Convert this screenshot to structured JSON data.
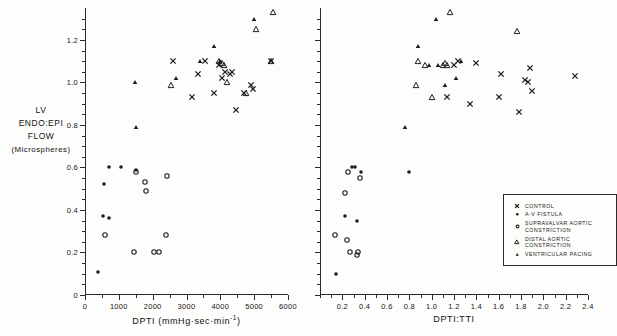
{
  "chart_data": {
    "type": "scatter",
    "title": "",
    "ylabel_lines": [
      "LV",
      "ENDO:EPI",
      "FLOW",
      "(Microspheres)"
    ],
    "ylim": [
      0,
      1.35
    ],
    "yticks": [
      0,
      0.2,
      0.4,
      0.6,
      0.8,
      1.0,
      1.2
    ],
    "ytick_labels": [
      "0",
      "0.2",
      "0.4",
      "0.6",
      "0.8",
      "1.0",
      "1.2"
    ],
    "grid": false,
    "legend_position": "right-panel-lower-right",
    "legend": [
      {
        "label": "CONTROL",
        "marker": "cross-x",
        "key": "control"
      },
      {
        "label": "A-V FISTULA",
        "marker": "filled-circle",
        "key": "av_fistula"
      },
      {
        "label": "SUPRAVALVAR AORTIC CONSTRICTION",
        "marker": "open-circle",
        "key": "supravalvar"
      },
      {
        "label": "DISTAL AORTIC CONSTRICTION",
        "marker": "open-triangle",
        "key": "distal_aortic"
      },
      {
        "label": "VENTRICULAR PACING",
        "marker": "filled-triangle",
        "key": "ventricular_pacing"
      }
    ],
    "panels": [
      {
        "id": "left",
        "xlabel": "DPTI  (mmHg·sec·min",
        "xlabel_sup": "-1",
        "xlabel_tail": ")",
        "xlim": [
          0,
          6000
        ],
        "xticks": [
          0,
          1000,
          2000,
          3000,
          4000,
          5000,
          6000
        ],
        "xtick_labels": [
          "0",
          "1000",
          "2000",
          "3000",
          "4000",
          "5000",
          "6000"
        ],
        "xminor_step": 500,
        "series": [
          {
            "key": "control",
            "marker": "cross-x",
            "points": [
              [
                2600,
                1.1
              ],
              [
                3150,
                0.93
              ],
              [
                3350,
                1.04
              ],
              [
                3550,
                1.1
              ],
              [
                3800,
                0.95
              ],
              [
                3950,
                1.08
              ],
              [
                4050,
                1.02
              ],
              [
                4150,
                1.05
              ],
              [
                4300,
                1.04
              ],
              [
                4350,
                1.05
              ],
              [
                4450,
                0.87
              ],
              [
                4700,
                0.95
              ],
              [
                4900,
                0.99
              ],
              [
                4980,
                0.97
              ],
              [
                5500,
                1.1
              ]
            ]
          },
          {
            "key": "av_fistula",
            "marker": "filled-circle",
            "points": [
              [
                380,
                0.11
              ],
              [
                520,
                0.37
              ],
              [
                560,
                0.52
              ],
              [
                700,
                0.36
              ],
              [
                720,
                0.6
              ],
              [
                1050,
                0.6
              ],
              [
                1520,
                0.59
              ]
            ]
          },
          {
            "key": "supravalvar",
            "marker": "open-circle",
            "points": [
              [
                600,
                0.28
              ],
              [
                1450,
                0.2
              ],
              [
                1500,
                0.58
              ],
              [
                1780,
                0.53
              ],
              [
                1800,
                0.49
              ],
              [
                2050,
                0.2
              ],
              [
                2200,
                0.2
              ],
              [
                2400,
                0.28
              ],
              [
                2420,
                0.56
              ]
            ]
          },
          {
            "key": "distal_aortic",
            "marker": "open-triangle",
            "points": [
              [
                2550,
                0.99
              ],
              [
                3950,
                1.1
              ],
              [
                4050,
                1.09
              ],
              [
                4100,
                1.08
              ],
              [
                4200,
                1.0
              ],
              [
                4750,
                0.95
              ],
              [
                5050,
                1.25
              ],
              [
                5500,
                1.1
              ],
              [
                5560,
                1.33
              ]
            ]
          },
          {
            "key": "ventricular_pacing",
            "marker": "filled-triangle",
            "points": [
              [
                1480,
                1.0
              ],
              [
                1500,
                0.79
              ],
              [
                2700,
                1.02
              ],
              [
                3400,
                1.1
              ],
              [
                3800,
                1.17
              ],
              [
                3980,
                1.1
              ],
              [
                5000,
                1.3
              ]
            ]
          }
        ]
      },
      {
        "id": "right",
        "xlabel": "DPTI:TTI",
        "xlim": [
          0,
          2.4
        ],
        "xticks": [
          0.2,
          0.4,
          0.6,
          0.8,
          1.0,
          1.2,
          1.4,
          1.6,
          1.8,
          2.0,
          2.2,
          2.4
        ],
        "xtick_labels": [
          "0.2",
          "0.4",
          "0.6",
          "0.8",
          "1.0",
          "1.2",
          "1.4",
          "1.6",
          "1.8",
          "2.0",
          "2.2",
          "2.4"
        ],
        "xminor_step": 0.1,
        "series": [
          {
            "key": "control",
            "marker": "cross-x",
            "points": [
              [
                1.14,
                0.93
              ],
              [
                1.2,
                1.08
              ],
              [
                1.24,
                1.1
              ],
              [
                1.34,
                0.9
              ],
              [
                1.4,
                1.09
              ],
              [
                1.6,
                0.93
              ],
              [
                1.62,
                1.04
              ],
              [
                1.78,
                0.86
              ],
              [
                1.84,
                1.01
              ],
              [
                1.86,
                1.0
              ],
              [
                1.88,
                1.07
              ],
              [
                1.9,
                0.96
              ],
              [
                2.28,
                1.03
              ]
            ]
          },
          {
            "key": "av_fistula",
            "marker": "filled-circle",
            "points": [
              [
                0.14,
                0.1
              ],
              [
                0.22,
                0.37
              ],
              [
                0.29,
                0.6
              ],
              [
                0.31,
                0.6
              ],
              [
                0.33,
                0.35
              ],
              [
                0.37,
                0.58
              ],
              [
                0.8,
                0.58
              ]
            ]
          },
          {
            "key": "supravalvar",
            "marker": "open-circle",
            "points": [
              [
                0.13,
                0.28
              ],
              [
                0.22,
                0.48
              ],
              [
                0.24,
                0.26
              ],
              [
                0.25,
                0.58
              ],
              [
                0.27,
                0.2
              ],
              [
                0.33,
                0.19
              ],
              [
                0.34,
                0.2
              ],
              [
                0.36,
                0.55
              ]
            ]
          },
          {
            "key": "distal_aortic",
            "marker": "open-triangle",
            "points": [
              [
                0.86,
                0.99
              ],
              [
                0.88,
                1.1
              ],
              [
                0.94,
                1.08
              ],
              [
                1.0,
                0.93
              ],
              [
                1.1,
                1.08
              ],
              [
                1.12,
                1.09
              ],
              [
                1.14,
                1.08
              ],
              [
                1.16,
                1.33
              ],
              [
                1.76,
                1.24
              ]
            ]
          },
          {
            "key": "ventricular_pacing",
            "marker": "filled-triangle",
            "points": [
              [
                0.76,
                0.79
              ],
              [
                0.88,
                1.17
              ],
              [
                0.98,
                1.08
              ],
              [
                1.04,
                1.3
              ],
              [
                1.06,
                1.08
              ],
              [
                1.12,
                0.99
              ],
              [
                1.22,
                1.02
              ],
              [
                1.26,
                1.1
              ]
            ]
          }
        ]
      }
    ]
  }
}
